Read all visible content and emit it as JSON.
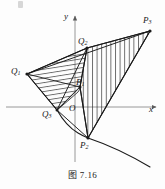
{
  "figure": {
    "caption": "图 7.16",
    "axes": {
      "x_label": "x",
      "y_label": "y",
      "origin_label": "O",
      "origin": {
        "x": 75,
        "y": 107
      },
      "x_axis": {
        "x1": 6,
        "y1": 107,
        "x2": 158,
        "y2": 107
      },
      "y_axis": {
        "x1": 75,
        "y1": 160,
        "x2": 75,
        "y2": 14
      }
    },
    "points": [
      {
        "name": "P1",
        "label": "P",
        "sub": "1",
        "x": 80,
        "y": 87,
        "label_x": 76,
        "label_y": 79
      },
      {
        "name": "P2",
        "label": "P",
        "sub": "2",
        "x": 88,
        "y": 138,
        "label_x": 80,
        "label_y": 141
      },
      {
        "name": "P3",
        "label": "P",
        "sub": "3",
        "x": 150,
        "y": 31,
        "label_x": 143,
        "label_y": 16
      },
      {
        "name": "Q1",
        "label": "Q",
        "sub": "1",
        "x": 27,
        "y": 74,
        "label_x": 12,
        "label_y": 68
      },
      {
        "name": "Q2",
        "label": "Q",
        "sub": "2",
        "x": 87,
        "y": 48,
        "label_x": 79,
        "label_y": 38
      },
      {
        "name": "Q3",
        "label": "Q",
        "sub": "3",
        "x": 57,
        "y": 110,
        "label_x": 43,
        "label_y": 111
      }
    ],
    "regions": [
      {
        "name": "left-hatched-region",
        "hatch": "horizontal",
        "vertices": "27,74 87,48 80,87 57,110"
      },
      {
        "name": "right-hatched-region",
        "hatch": "vertical",
        "vertices": "80,87 87,48 150,31 88,138"
      }
    ],
    "curve": {
      "name": "parabola-arc",
      "path": "M 57,110 Q 68,133 88,138 Q 120,145 150,167"
    },
    "colors": {
      "ink": "#1a1a1a",
      "axis": "#8d8d8d",
      "hatch": "#2b2b2b",
      "background": "#fdfdfd"
    }
  }
}
